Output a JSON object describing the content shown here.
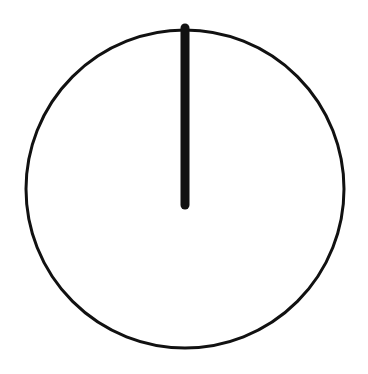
{
  "diagram": {
    "colors": {
      "background": "#ffffff",
      "stroke": "#111111"
    },
    "circle": {
      "cx": 185,
      "cy": 189,
      "r": 159,
      "stroke_width": 3
    },
    "radius_line": {
      "x1": 185,
      "y1": 28,
      "x2": 185,
      "y2": 205,
      "stroke_width": 9
    }
  }
}
